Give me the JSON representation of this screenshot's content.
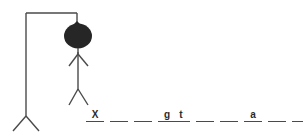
{
  "scene": {
    "title": "Hangman game drawing",
    "background_color": "#ffffff",
    "line_color": "#4a4a4a",
    "head_color": "#262626",
    "gallows": {
      "post_label": "gallows-post",
      "beam_label": "gallows-beam",
      "rope_label": "gallows-rope",
      "base_label": "gallows-base"
    },
    "figure": {
      "head_label": "hangman-head",
      "body_label": "hangman-body",
      "arms_label": "hangman-arms",
      "legs_label": "hangman-legs",
      "parts_drawn": 6
    }
  },
  "puzzle": {
    "words": [
      {
        "index": 1,
        "length": 4,
        "slots": [
          {
            "letter": "X",
            "revealed": true
          },
          {
            "letter": "",
            "revealed": false
          },
          {
            "letter": "",
            "revealed": false
          },
          {
            "letter": "g",
            "revealed": true
          }
        ]
      },
      {
        "index": 2,
        "length": 6,
        "slots": [
          {
            "letter": "t",
            "revealed": true
          },
          {
            "letter": "",
            "revealed": false
          },
          {
            "letter": "",
            "revealed": false
          },
          {
            "letter": "a",
            "revealed": true
          },
          {
            "letter": "",
            "revealed": false
          },
          {
            "letter": "",
            "revealed": false
          }
        ]
      }
    ]
  }
}
